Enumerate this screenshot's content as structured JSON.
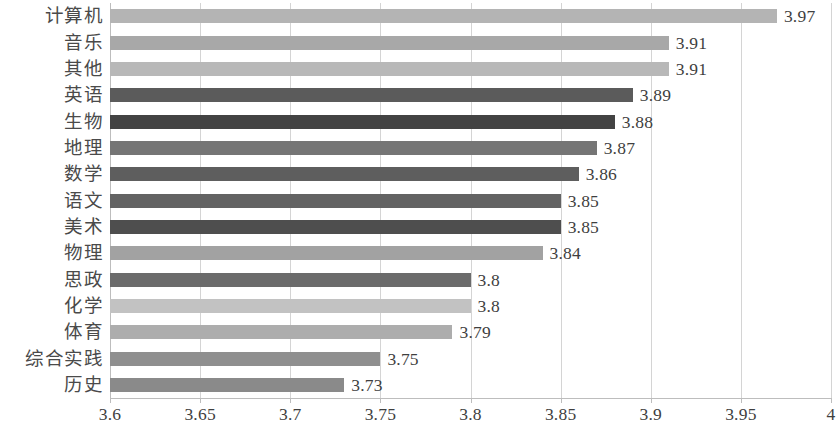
{
  "chart_data": {
    "type": "bar",
    "orientation": "horizontal",
    "title": "",
    "subtitle": "",
    "xlabel": "",
    "ylabel": "",
    "xlim": [
      3.6,
      4
    ],
    "xticks": [
      "3.6",
      "3.65",
      "3.7",
      "3.75",
      "3.8",
      "3.85",
      "3.9",
      "3.95",
      "4"
    ],
    "xtick_values": [
      3.6,
      3.65,
      3.7,
      3.75,
      3.8,
      3.85,
      3.9,
      3.95,
      4
    ],
    "grid": true,
    "legend": "none",
    "categories": [
      "计算机",
      "音乐",
      "其他",
      "英语",
      "生物",
      "地理",
      "数学",
      "语文",
      "美术",
      "物理",
      "思政",
      "化学",
      "体育",
      "综合实践",
      "历史"
    ],
    "values": [
      3.97,
      3.91,
      3.91,
      3.89,
      3.88,
      3.87,
      3.86,
      3.85,
      3.85,
      3.84,
      3.8,
      3.8,
      3.79,
      3.75,
      3.73
    ],
    "value_labels": [
      "3.97",
      "3.91",
      "3.91",
      "3.89",
      "3.88",
      "3.87",
      "3.86",
      "3.85",
      "3.85",
      "3.84",
      "3.8",
      "3.8",
      "3.79",
      "3.75",
      "3.73"
    ],
    "bar_colors": [
      "#b4b4b4",
      "#a8a8a8",
      "#b8b8b8",
      "#5b5b5b",
      "#434343",
      "#757575",
      "#5e5e5e",
      "#636363",
      "#4e4e4e",
      "#a2a2a2",
      "#6b6b6b",
      "#c2c2c2",
      "#adadad",
      "#8f8f8f",
      "#8a8a8a"
    ]
  },
  "colors": {
    "gridline": "#d4d4d4",
    "axis": "#bdbdbd",
    "text": "#3f3f3f",
    "background": "#ffffff"
  }
}
